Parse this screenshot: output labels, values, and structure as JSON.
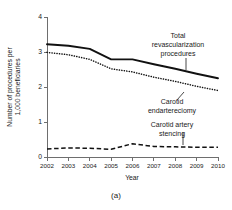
{
  "caption": "(a)",
  "chart_data": {
    "type": "line",
    "title": "",
    "xlabel": "Year",
    "ylabel": "Number of procedures per 1,000 beneficiaries",
    "ylabel_line1": "Number of procedures per",
    "ylabel_line2": "1,000 beneficiaries",
    "x": [
      2002,
      2003,
      2004,
      2005,
      2006,
      2007,
      2008,
      2009,
      2010
    ],
    "categories": [
      "2002",
      "2003",
      "2004",
      "2005",
      "2006",
      "2007",
      "2008",
      "2009",
      "2010"
    ],
    "xlim": [
      2002,
      2010
    ],
    "ylim": [
      0,
      4
    ],
    "yticks": [
      0,
      1,
      2,
      3,
      4
    ],
    "yticklabels": [
      "0",
      "1",
      "2",
      "3",
      "4"
    ],
    "grid": false,
    "legend": "annotations",
    "series": [
      {
        "name": "Total revascularization procedures",
        "style": "solid",
        "color": "#111111",
        "values": [
          3.22,
          3.18,
          3.09,
          2.79,
          2.79,
          2.65,
          2.52,
          2.38,
          2.25
        ]
      },
      {
        "name": "Carotid endartereciomy",
        "style": "dotted",
        "color": "#111111",
        "values": [
          2.99,
          2.92,
          2.79,
          2.52,
          2.43,
          2.28,
          2.16,
          2.02,
          1.9
        ]
      },
      {
        "name": "Carotid artery stencing",
        "style": "dashed",
        "color": "#111111",
        "values": [
          0.23,
          0.26,
          0.25,
          0.22,
          0.38,
          0.3,
          0.29,
          0.28,
          0.28
        ]
      }
    ],
    "annotations": [
      {
        "id": "total-revascularization",
        "lines": [
          "Total",
          "revascularization",
          "procedures"
        ],
        "target_year": 2009,
        "target_value": 2.38
      },
      {
        "id": "carotid-endarterectomy",
        "lines": [
          "Carotid",
          "endartereciomy"
        ],
        "target_year": 2008.6,
        "target_value": 2.06
      },
      {
        "id": "carotid-artery-stenting",
        "lines": [
          "Carotid artery",
          "stencing"
        ],
        "target_year": 2008.4,
        "target_value": 0.28
      }
    ]
  }
}
